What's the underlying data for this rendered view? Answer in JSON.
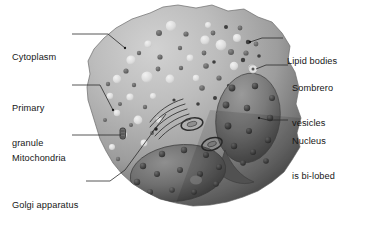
{
  "diagram": {
    "background_color": "#ffffff",
    "cell_fill_light": "#c3c3c3",
    "cell_fill_mid": "#9d9d9d",
    "cell_fill_dark": "#4d4d4d",
    "nucleus_color": "#6f6f6f",
    "nucleus_dark": "#3a3a3a",
    "granule_light_color": "#e8e8e8",
    "granule_dark_color": "#6a6a6a",
    "lipid_body_color": "#4a4a4a",
    "leader_color": "#2b2b2b",
    "label_color": "#161616"
  },
  "labels": [
    {
      "id": "cytoplasm",
      "text": "Cytoplasm",
      "side": "left",
      "x": 12,
      "y": 29,
      "lines": [
        "Cytoplasm"
      ]
    },
    {
      "id": "primary-granule",
      "text": "Primary granule",
      "side": "left",
      "x": 12,
      "y": 80,
      "lines": [
        "Primary",
        "granule"
      ]
    },
    {
      "id": "mitochondria",
      "text": "Mitochondria",
      "side": "left",
      "x": 12,
      "y": 130,
      "lines": [
        "Mitochondria"
      ]
    },
    {
      "id": "golgi-apparatus",
      "text": "Golgi apparatus",
      "side": "left",
      "x": 12,
      "y": 177,
      "lines": [
        "Golgi apparatus"
      ]
    },
    {
      "id": "lipid-bodies",
      "text": "Lipid bodies",
      "side": "right",
      "x": 287,
      "y": 33,
      "lines": [
        "Lipid bodies"
      ]
    },
    {
      "id": "sombrero-vesicles",
      "text": "Sombrero vesicles",
      "side": "right",
      "x": 292,
      "y": 60,
      "lines": [
        "Sombrero",
        "vesicles"
      ]
    },
    {
      "id": "nucleus-bilobed",
      "text": "Nucleus is bi-lobed",
      "side": "right",
      "x": 292,
      "y": 113,
      "lines": [
        "Nucleus",
        "is bi-lobed"
      ]
    }
  ],
  "leaders": [
    {
      "id": "leader-cytoplasm",
      "points": "72,34 108,34 125,48"
    },
    {
      "id": "leader-primary-granule",
      "points": "72,85 100,85 113,110"
    },
    {
      "id": "leader-mitochondria",
      "points": "72,135 122,135"
    },
    {
      "id": "leader-golgi-apparatus",
      "points": "86,181 110,181 125,170 167,113"
    },
    {
      "id": "leader-lipid-bodies",
      "points": "283,38 262,38 248,42"
    },
    {
      "id": "leader-sombrero",
      "points": "288,65 266,65 253,69"
    },
    {
      "id": "leader-nucleus",
      "points": "288,120 268,120 258,118"
    }
  ],
  "structures": [
    {
      "id": "cell-membrane",
      "name": "cell outline"
    },
    {
      "id": "nucleus-lobe-upper-right",
      "name": "upper right nuclear lobe"
    },
    {
      "id": "nucleus-lobe-lower-left",
      "name": "lower left nuclear lobe"
    },
    {
      "id": "golgi-stack",
      "name": "Golgi stack cisternae"
    },
    {
      "id": "sombrero-vesicle-1",
      "name": "sombrero vesicle"
    },
    {
      "id": "sombrero-vesicle-2",
      "name": "sombrero vesicle"
    },
    {
      "id": "mitochondrion",
      "name": "mitochondrion"
    }
  ]
}
